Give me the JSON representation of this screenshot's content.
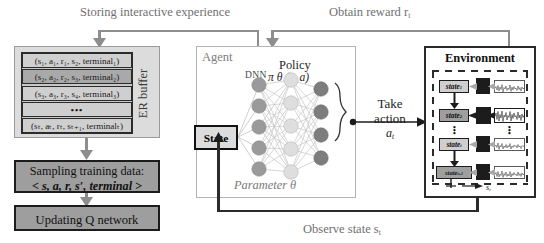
{
  "diagram": {
    "captions": {
      "storing": "Storing interactive experience",
      "reward": "Obtain reward r",
      "reward_sub": "t",
      "observe": "Observe state s",
      "observe_sub": "t"
    },
    "er_buffer": {
      "label": "ER buffer",
      "rows": [
        {
          "text": "(s₁, a₁, r₁, s₂, terminal₁)",
          "highlighted": false
        },
        {
          "text": "(s₂, a₂, r₂, s₃, terminal₂)",
          "highlighted": true
        },
        {
          "text": "(s₃, a₃, r₃, s₄, terminal₃)",
          "highlighted": false
        },
        {
          "text": "•••",
          "highlighted": false
        },
        {
          "text": "(sₜ, aₜ, rₜ, sₜ₊₁, terminalₜ)",
          "highlighted": false
        }
      ]
    },
    "sampling": {
      "line1": "Sampling training data:",
      "line2": "< s, a, r, s′, terminal >"
    },
    "updating": {
      "line1": "Updating Q network"
    },
    "agent": {
      "title": "Agent",
      "dnn_label": "DNN",
      "policy_label": "Policy",
      "policy_fn": "π θ (s, a)",
      "parameter_label": "Parameter  θ",
      "state_box": "State",
      "network": {
        "input_nodes": 5,
        "hidden_nodes": 5,
        "output_nodes": 4,
        "input_color": "#9a9a9a",
        "hidden_color": "#dcdcdc",
        "output_color": "#7d7d7d"
      }
    },
    "take_action": {
      "line1": "Take",
      "line2": "action",
      "symbol": "a",
      "symbol_sub": "t"
    },
    "environment": {
      "title": "Environment",
      "axis_label": "s",
      "axis_label_sub": "t",
      "states": [
        {
          "label": "state",
          "sub": "1",
          "highlighted": false
        },
        {
          "label": "state",
          "sub": "2",
          "highlighted": true
        },
        {
          "label": "state",
          "sub": "t",
          "highlighted": false
        },
        {
          "label": "state",
          "sub": "t+1",
          "highlighted": true
        }
      ],
      "vertical_dots": "⋮"
    },
    "colors": {
      "wire": "#8d8d8d",
      "wire_dark": "#2b2b2b",
      "panel_border": "#b4b4b4",
      "env_border": "#2b2b2b",
      "dark_fill": "#9e9e9e",
      "buffer_fill": "#dcdcdc"
    }
  }
}
